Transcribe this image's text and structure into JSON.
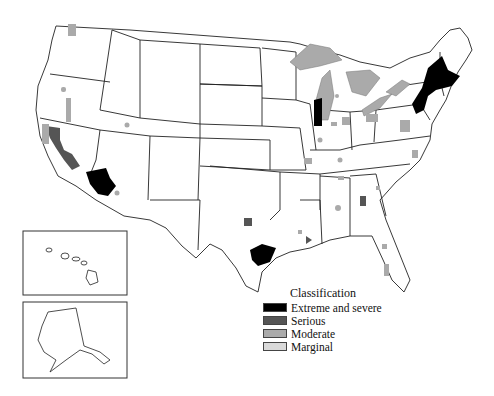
{
  "map": {
    "subject": "Classification of areas in the United States",
    "insets": [
      {
        "name": "Hawaii"
      },
      {
        "name": "Alaska"
      }
    ]
  },
  "legend": {
    "title": "Classification",
    "items": [
      {
        "label": "Extreme and severe",
        "color": "#000000"
      },
      {
        "label": "Serious",
        "color": "#555555"
      },
      {
        "label": "Moderate",
        "color": "#aaaaaa"
      },
      {
        "label": "Marginal",
        "color": "#d9d9d9"
      }
    ]
  }
}
